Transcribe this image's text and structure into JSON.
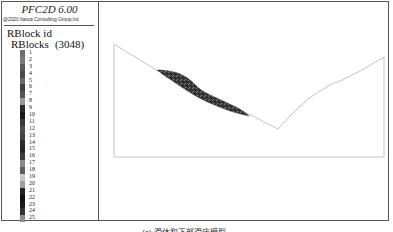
{
  "legend": {
    "app_title": "PFC2D 6.00",
    "copyright": "@2020 Itasca Consulting Group,Inc",
    "title": "RBlock id",
    "subtitle": "RBlocks",
    "count": "(3048)",
    "items": [
      {
        "label": "1",
        "color": "#6e6e6e"
      },
      {
        "label": "2",
        "color": "#7a7a7a"
      },
      {
        "label": "3",
        "color": "#5a5a5a"
      },
      {
        "label": "4",
        "color": "#4a4a4a"
      },
      {
        "label": "5",
        "color": "#6a6a6a"
      },
      {
        "label": "6",
        "color": "#3e3e3e"
      },
      {
        "label": "7",
        "color": "#555555"
      },
      {
        "label": "8",
        "color": "#9a9a9a"
      },
      {
        "label": "9",
        "color": "#2a2a2a"
      },
      {
        "label": "10",
        "color": "#1a1a1a"
      },
      {
        "label": "11",
        "color": "#3a3a3a"
      },
      {
        "label": "12",
        "color": "#4e4e4e"
      },
      {
        "label": "13",
        "color": "#444444"
      },
      {
        "label": "14",
        "color": "#2e2e2e"
      },
      {
        "label": "15",
        "color": "#262626"
      },
      {
        "label": "16",
        "color": "#3c3c3c"
      },
      {
        "label": "17",
        "color": "#8a8a8a"
      },
      {
        "label": "18",
        "color": "#5e5e5e"
      },
      {
        "label": "19",
        "color": "#c8c8c8"
      },
      {
        "label": "20",
        "color": "#9e9e9e"
      },
      {
        "label": "21",
        "color": "#222222"
      },
      {
        "label": "22",
        "color": "#111111"
      },
      {
        "label": "23",
        "color": "#1c1c1c"
      },
      {
        "label": "24",
        "color": "#333333"
      },
      {
        "label": "25",
        "color": "#8e8e8e"
      }
    ]
  },
  "view": {
    "outline_color": "#c4c4c4",
    "slide_color": "#3a3a3a"
  },
  "caption": "(a) 滑体和下部滑床模型"
}
